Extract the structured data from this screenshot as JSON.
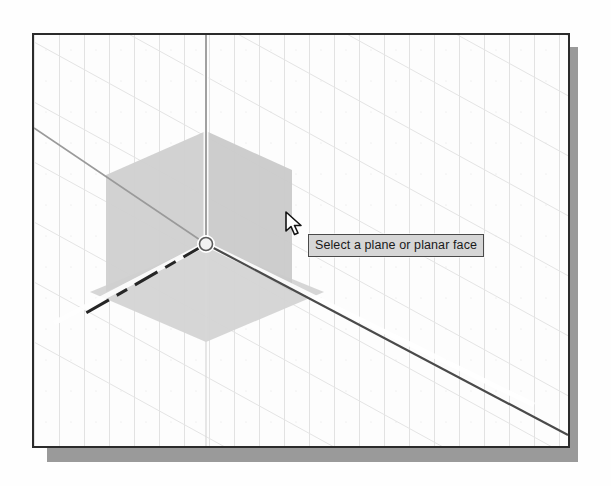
{
  "app": {
    "kind": "cad-3d-viewport",
    "background_color": "#fdfdfd",
    "border_color": "#2b2b2b",
    "shadow_color": "#9a9a9a"
  },
  "viewport": {
    "name": "model-space-viewport",
    "grid": {
      "visible": true,
      "line_color": "#dcdcdc",
      "vertical_spacing_px": 25,
      "diagonal_spacing_px": 62,
      "diagonal_slope": -0.55
    }
  },
  "ucs_widget": {
    "name": "dynamic-ucs-plane-selector",
    "origin_x": 204,
    "origin_y": 242,
    "origin_marker": "circle",
    "plane_fill_color": "#cccccc",
    "plane_highlight_color": "#d5d5d5",
    "planes": [
      {
        "id": "left-plane",
        "label": "XZ plane",
        "fill": "#cfcfcf"
      },
      {
        "id": "right-plane",
        "label": "YZ plane",
        "fill": "#c9c9c9"
      },
      {
        "id": "bottom-plane",
        "label": "XY plane",
        "fill": "#d2d2d2"
      }
    ],
    "axes": [
      {
        "id": "z-axis",
        "direction": "up",
        "style": "solid",
        "color": "#808080"
      },
      {
        "id": "x-axis-positive",
        "direction": "down-right",
        "style": "solid",
        "color": "#4d4d4d"
      },
      {
        "id": "x-axis-negative",
        "direction": "down-left",
        "style": "dashed",
        "color": "#2e2e2e"
      },
      {
        "id": "y-axis",
        "direction": "up-left",
        "style": "solid",
        "color": "#8c8c8c"
      }
    ]
  },
  "tooltip": {
    "name": "plane-selection-tooltip",
    "text": "Select a plane or planar face",
    "background_color": "#d6d6d6",
    "border_color": "#4a4a4a",
    "text_color": "#1a1a1a"
  },
  "cursor": {
    "name": "mouse-pointer",
    "type": "arrow",
    "x": 288,
    "y": 214,
    "fill": "#ffffff",
    "stroke": "#1a1a1a"
  }
}
